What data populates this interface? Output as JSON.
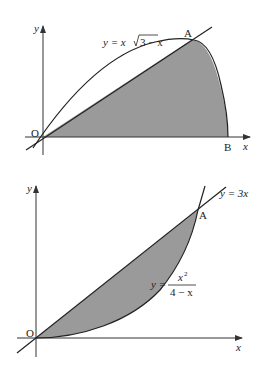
{
  "figure1": {
    "curve_label_prefix": "y = x",
    "curve_label_radicand": "3 − x",
    "point_A": "A",
    "point_B": "B",
    "origin": "O",
    "x_axis": "x",
    "y_axis": "y",
    "shade_color": "#9a9a9a"
  },
  "figure2": {
    "line_label": "y = 3x",
    "curve_label_lhs": "y =",
    "curve_label_num": "x",
    "curve_label_exp": "2",
    "curve_label_den": "4 − x",
    "point_A": "A",
    "origin": "O",
    "x_axis": "x",
    "y_axis": "y",
    "shade_color": "#9a9a9a"
  }
}
